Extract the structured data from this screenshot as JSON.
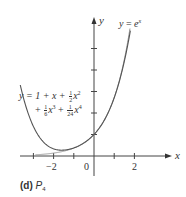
{
  "chart_data": {
    "type": "line",
    "title": "",
    "caption_label": "(d)",
    "caption_text": "P",
    "caption_sub": "4",
    "xlabel": "x",
    "ylabel": "y",
    "x_ticks": [
      -3,
      -2,
      -1,
      0,
      1,
      2
    ],
    "x_tick_labels": [
      "-2",
      "0",
      "2"
    ],
    "x_tick_label_values": [
      -2,
      0,
      2
    ],
    "y_ticks": [
      1,
      2,
      3,
      4,
      5
    ],
    "xlim": [
      -3.7,
      3.9
    ],
    "ylim": [
      -0.7,
      6.6
    ],
    "grid": false,
    "series": [
      {
        "name": "y = e^x",
        "function": "exp(x)",
        "x": [
          -3.0,
          -2.0,
          -1.0,
          0.0,
          0.5,
          1.0,
          1.5,
          1.8
        ],
        "values": [
          0.05,
          0.14,
          0.37,
          1.0,
          1.65,
          2.72,
          4.48,
          6.05
        ],
        "color": "#555555"
      },
      {
        "name": "y = 1 + x + 1/2 x^2 + 1/6 x^3 + 1/24 x^4",
        "function": "1 + x + x^2/2 + x^3/6 + x^4/24",
        "x": [
          -3.7,
          -3.0,
          -2.0,
          -1.6,
          -1.0,
          0.0,
          1.0,
          1.5,
          1.8
        ],
        "values": [
          2.05,
          1.38,
          0.33,
          0.23,
          0.375,
          1.0,
          2.71,
          4.39,
          5.82
        ],
        "color": "#555555"
      }
    ],
    "annotations": [
      {
        "text": "y = e^x",
        "near": "upper right of curve"
      },
      {
        "text": "y = 1 + x + 1/2 x^2 + 1/6 x^3 + 1/24 x^4",
        "near": "left branch of polynomial"
      }
    ]
  },
  "labels": {
    "y_axis": "y",
    "x_axis": "x",
    "exp_y": "y",
    "exp_eq": "=",
    "exp_e": "e",
    "exp_pow": "x",
    "poly_line1_prefix": "y = 1 + x +",
    "poly_frac1_num": "1",
    "poly_frac1_den": "2",
    "poly_line1_var": "x",
    "poly_line1_pow": "2",
    "poly_line2_plus1": "+",
    "poly_frac2_num": "1",
    "poly_frac2_den": "6",
    "poly_line2_var1": "x",
    "poly_line2_pow1": "3",
    "poly_line2_plus2": "+",
    "poly_frac3_num": "1",
    "poly_frac3_den": "24",
    "poly_line2_var2": "x",
    "poly_line2_pow2": "4",
    "tick_m2": "−2",
    "tick_0": "0",
    "tick_2": "2",
    "caption_bold": "(d)",
    "caption_p": "P",
    "caption_sub": "4"
  }
}
